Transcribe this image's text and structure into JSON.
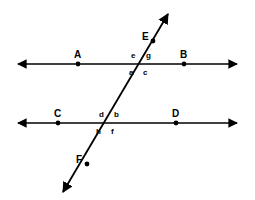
{
  "figure": {
    "kind": "geometry-diagram",
    "background_color": "#ffffff",
    "stroke_color": "#000000"
  },
  "point_labels": [
    {
      "id": "A",
      "text": "A",
      "x": 74,
      "y": 50,
      "on": "upper-line"
    },
    {
      "id": "B",
      "text": "B",
      "x": 180,
      "y": 50,
      "on": "upper-line"
    },
    {
      "id": "C",
      "text": "C",
      "x": 54,
      "y": 109,
      "on": "lower-line"
    },
    {
      "id": "D",
      "text": "D",
      "x": 172,
      "y": 109,
      "on": "lower-line"
    },
    {
      "id": "E",
      "text": "E",
      "x": 142,
      "y": 32,
      "on": "transversal"
    },
    {
      "id": "F",
      "text": "F",
      "x": 76,
      "y": 155,
      "on": "transversal"
    }
  ],
  "marked_points": [
    {
      "id": "A",
      "x": 78,
      "y": 64
    },
    {
      "id": "B",
      "x": 184,
      "y": 64
    },
    {
      "id": "C",
      "x": 58,
      "y": 123
    },
    {
      "id": "D",
      "x": 176,
      "y": 123
    },
    {
      "id": "E",
      "x": 153,
      "y": 41
    },
    {
      "id": "F",
      "x": 87,
      "y": 164
    }
  ],
  "angle_labels": [
    {
      "id": "e",
      "text": "e",
      "x": 131,
      "y": 52,
      "intersection": "upper",
      "position": "above-left"
    },
    {
      "id": "g",
      "text": "g",
      "x": 146,
      "y": 52,
      "intersection": "upper",
      "position": "above-right"
    },
    {
      "id": "a",
      "text": "a",
      "x": 129,
      "y": 69,
      "intersection": "upper",
      "position": "below-left"
    },
    {
      "id": "c",
      "text": "c",
      "x": 143,
      "y": 69,
      "intersection": "upper",
      "position": "below-right"
    },
    {
      "id": "d",
      "text": "d",
      "x": 99,
      "y": 111,
      "intersection": "lower",
      "position": "above-left"
    },
    {
      "id": "b",
      "text": "b",
      "x": 114,
      "y": 111,
      "intersection": "lower",
      "position": "above-right"
    },
    {
      "id": "h",
      "text": "h",
      "x": 96,
      "y": 128,
      "intersection": "lower",
      "position": "below-left"
    },
    {
      "id": "f",
      "text": "f",
      "x": 111,
      "y": 128,
      "intersection": "lower",
      "position": "below-right"
    }
  ],
  "lines": {
    "upper_line": {
      "name": "upper-parallel-line",
      "x1": 18,
      "y1": 64,
      "x2": 237,
      "y2": 64,
      "arrowheads": "both"
    },
    "lower_line": {
      "name": "lower-parallel-line",
      "x1": 18,
      "y1": 123,
      "x2": 237,
      "y2": 123,
      "arrowheads": "both"
    },
    "transversal": {
      "name": "transversal-line",
      "x1": 63,
      "y1": 192,
      "x2": 168,
      "y2": 14,
      "arrowheads": "both"
    }
  },
  "intersections": [
    {
      "id": "upper-intersection",
      "x": 140,
      "y": 64
    },
    {
      "id": "lower-intersection",
      "x": 105,
      "y": 123
    }
  ]
}
